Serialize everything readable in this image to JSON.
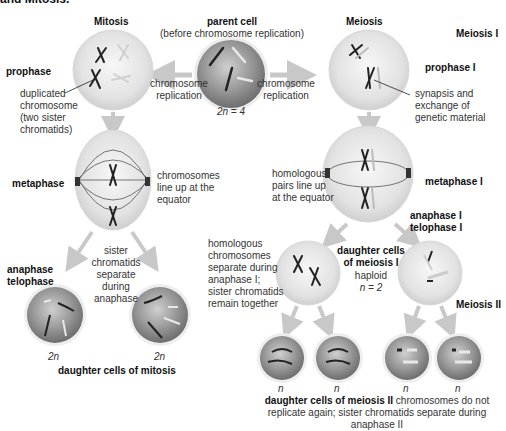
{
  "header": {
    "cut_title": "and Mitosis."
  },
  "columns": {
    "mitosis": "Mitosis",
    "meiosis": "Meiosis"
  },
  "parent": {
    "title": "parent cell",
    "subtitle": "(before chromosome replication)",
    "ploidy": "2n = 4"
  },
  "arrows": {
    "left_label_1": "chromosome",
    "left_label_2": "replication",
    "right_label_1": "chromosome",
    "right_label_2": "replication"
  },
  "mitosis": {
    "prophase": "prophase",
    "dup_1": "duplicated",
    "dup_2": "chromosome",
    "dup_3": "(two sister",
    "dup_4": "chromatids)",
    "metaphase": "metaphase",
    "meta_note_1": "chromosomes",
    "meta_note_2": "line up at the",
    "meta_note_3": "equator",
    "anaphase": "anaphase",
    "telophase": "telophase",
    "sep_1": "sister",
    "sep_2": "chromatids",
    "sep_3": "separate",
    "sep_4": "during",
    "sep_5": "anaphase",
    "daughter_left_ploidy": "2n",
    "daughter_right_ploidy": "2n",
    "daughters_caption": "daughter cells of mitosis"
  },
  "meiosis": {
    "stage_I": "Meiosis I",
    "prophase_I": "prophase I",
    "syn_1": "synapsis and",
    "syn_2": "exchange of",
    "syn_3": "genetic material",
    "hom_1": "homologous",
    "hom_2": "pairs line up",
    "hom_3": "at the equator",
    "metaphase_I": "metaphase I",
    "anaphase_I": "anaphase I",
    "telophase_I": "telophase I",
    "homsep_1": "homologous",
    "homsep_2": "chromosomes",
    "homsep_3": "separate during",
    "homsep_4": "anaphase I;",
    "homsep_5": "sister chromatids",
    "homsep_6": "remain together",
    "daughters_I_1": "daughter cells",
    "daughters_I_2": "of meiosis I",
    "haploid": "haploid",
    "haploid_n": "n = 2",
    "stage_II": "Meiosis II",
    "final_ploidy": [
      "n",
      "n",
      "n",
      "n"
    ],
    "caption_bold": "daughter cells of meiosis II",
    "caption_rest_1": " chromosomes do not",
    "caption_rest_2": "replicate again; sister chromatids separate during anaphase II"
  },
  "colors": {
    "arrow": "#c8c8c8",
    "cell_light": "#e6e6e6",
    "cell_dark": "#8a8a8a",
    "chromosome_dark": "#222222",
    "chromosome_light": "#d8d8d8"
  }
}
